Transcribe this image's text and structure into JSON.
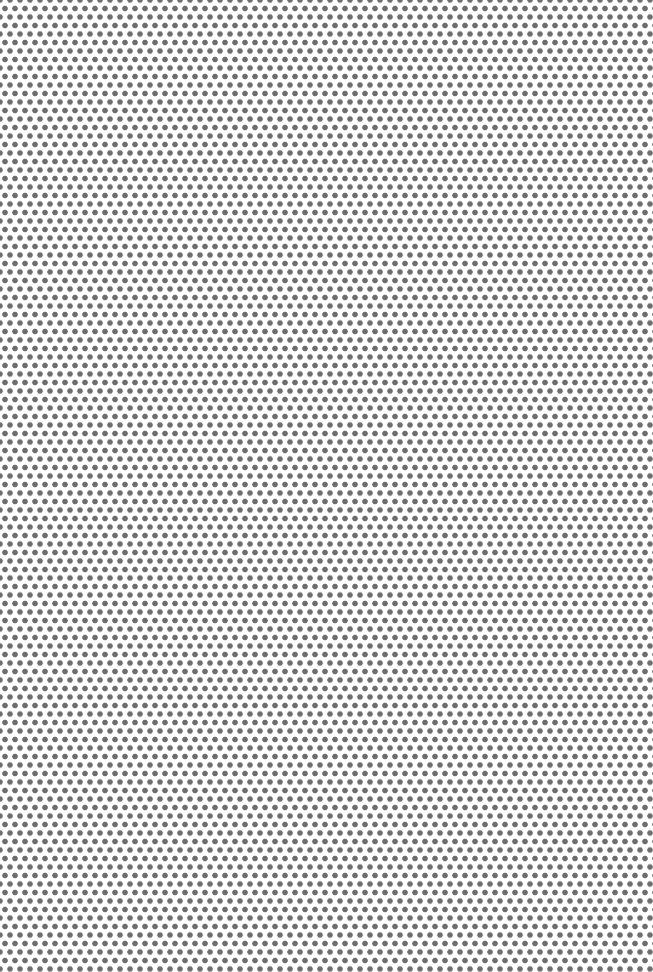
{
  "image": {
    "description": "Uniform staggered dot-grid pattern",
    "background_color": "#ffffff",
    "dot_color": "#6e6e6e",
    "dot_spacing_x_px": 10,
    "row_spacing_px": 8.5,
    "dot_diameter_px": 5
  }
}
